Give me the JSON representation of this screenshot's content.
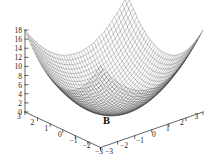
{
  "figure": {
    "background_color": "#ffffff",
    "axis_color": "#222222",
    "mesh_color": "#3a3a3a",
    "label": "B"
  },
  "chart_data": {
    "type": "surface",
    "title": "",
    "subtitle": "",
    "annotation": "B",
    "xlabel": "",
    "ylabel": "",
    "zlabel": "",
    "function": "z = x^2 + y^2",
    "grid": false,
    "legend": "none",
    "projection": "3d",
    "mesh_lines_x": 40,
    "mesh_lines_y": 40,
    "xlim": [
      -3,
      3
    ],
    "ylim": [
      -3,
      3
    ],
    "zlim": [
      0,
      18
    ],
    "x_ticks": [
      3,
      2,
      1,
      0,
      -1,
      -2,
      -3
    ],
    "x_tick_labels": [
      "3",
      "2",
      "1",
      "0",
      "−1",
      "−2",
      "−3"
    ],
    "y_ticks": [
      -3,
      -2,
      -1,
      0,
      1,
      2,
      3
    ],
    "y_tick_labels": [
      "−3",
      "−2",
      "−1",
      "0",
      "1",
      "2",
      "3"
    ],
    "z_ticks": [
      0,
      2,
      4,
      6,
      8,
      10,
      12,
      14,
      16,
      18
    ],
    "z_tick_labels": [
      "0",
      "2",
      "4",
      "6",
      "8",
      "10",
      "12",
      "14",
      "16",
      "18"
    ],
    "corner_values": {
      "front": 0,
      "left": 18,
      "back": 18,
      "right": 18
    },
    "surface_samples": [
      {
        "x": -3,
        "y": -3,
        "z": 18
      },
      {
        "x": -3,
        "y": 0,
        "z": 9
      },
      {
        "x": -3,
        "y": 3,
        "z": 18
      },
      {
        "x": 0,
        "y": -3,
        "z": 9
      },
      {
        "x": 0,
        "y": 0,
        "z": 0
      },
      {
        "x": 0,
        "y": 3,
        "z": 9
      },
      {
        "x": 3,
        "y": -3,
        "z": 18
      },
      {
        "x": 3,
        "y": 0,
        "z": 9
      },
      {
        "x": 3,
        "y": 3,
        "z": 18
      }
    ]
  },
  "z_axis": {
    "ticks": [
      {
        "label": "18",
        "top": 27.0
      },
      {
        "label": "16",
        "top": 36.1
      },
      {
        "label": "14",
        "top": 45.2
      },
      {
        "label": "12",
        "top": 54.3
      },
      {
        "label": "10",
        "top": 63.4
      },
      {
        "label": "8",
        "top": 72.5
      },
      {
        "label": "6",
        "top": 81.6
      },
      {
        "label": "4",
        "top": 90.7
      },
      {
        "label": "2",
        "top": 99.8
      },
      {
        "label": "0",
        "top": 108.9
      }
    ]
  },
  "x_axis": {
    "ticks": [
      {
        "label": "3",
        "left": 17.0,
        "top": 113.0
      },
      {
        "label": "2",
        "left": 30.5,
        "top": 119.0
      },
      {
        "label": "1",
        "left": 44.5,
        "top": 125.0
      },
      {
        "label": "0",
        "left": 58.0,
        "top": 130.8
      },
      {
        "label": "−1",
        "left": 69.5,
        "top": 136.5
      },
      {
        "label": "−2",
        "left": 82.5,
        "top": 142.0
      },
      {
        "label": "−3",
        "left": 95.0,
        "top": 147.5
      }
    ]
  },
  "y_axis": {
    "ticks": [
      {
        "label": "−3",
        "left": 105.0,
        "top": 147.5
      },
      {
        "label": "−2",
        "left": 120.0,
        "top": 142.0
      },
      {
        "label": "−1",
        "left": 136.0,
        "top": 136.5
      },
      {
        "label": "0",
        "left": 152.0,
        "top": 130.8
      },
      {
        "label": "1",
        "left": 166.0,
        "top": 125.0
      },
      {
        "label": "2",
        "left": 180.0,
        "top": 119.0
      },
      {
        "label": "3",
        "left": 194.5,
        "top": 113.0
      }
    ]
  }
}
